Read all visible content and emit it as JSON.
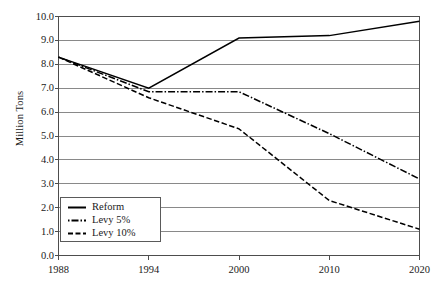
{
  "chart_data": {
    "type": "line",
    "title": "",
    "xlabel": "",
    "ylabel": "Million Tons",
    "categories": [
      "1988",
      "1994",
      "2000",
      "2010",
      "2020"
    ],
    "ylim": [
      0.0,
      10.0
    ],
    "y_ticks": [
      "0.0",
      "1.0",
      "2.0",
      "3.0",
      "4.0",
      "5.0",
      "6.0",
      "7.0",
      "8.0",
      "9.0",
      "10.0"
    ],
    "y_tick_step": 1.0,
    "grid": "horizontal",
    "legend_position": "bottom-left",
    "series": [
      {
        "name": "Reform",
        "style": "solid",
        "color": "#000000",
        "values": [
          8.3,
          7.0,
          9.1,
          9.2,
          9.8
        ]
      },
      {
        "name": "Levy 5%",
        "style": "dash-dot",
        "color": "#000000",
        "values": [
          8.3,
          6.85,
          6.85,
          5.1,
          3.2
        ]
      },
      {
        "name": "Levy 10%",
        "style": "dashed",
        "color": "#000000",
        "values": [
          8.3,
          6.6,
          5.3,
          2.3,
          1.1
        ]
      }
    ]
  },
  "axis": {
    "y_title": "Million Tons"
  },
  "colors": {
    "frame": "#4d4d4d",
    "grid": "#6b6b6b",
    "series": "#000000",
    "background": "#ffffff"
  }
}
